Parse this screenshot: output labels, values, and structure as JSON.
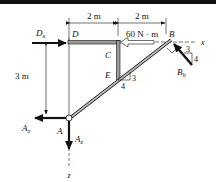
{
  "figure": {
    "type": "free-body-diagram",
    "colors": {
      "ink": "#111111",
      "member_fill": "#9a9a9a",
      "background": "#ffffff"
    }
  },
  "dimensions": {
    "top_left": "2 m",
    "top_right": "2 m",
    "left_vertical": "3 m"
  },
  "points": {
    "A": "A",
    "B": "B",
    "C": "C",
    "D": "D",
    "E": "E"
  },
  "forces": {
    "Dx": {
      "main": "D",
      "sub": "x"
    },
    "Ax": {
      "main": "A",
      "sub": "x"
    },
    "Az": {
      "main": "A",
      "sub": "z"
    },
    "Bh": {
      "main": "B",
      "sub": "h"
    },
    "moment": "60 N · m"
  },
  "axes": {
    "x": "x",
    "z": "z"
  },
  "slopes": {
    "rod_at_E": {
      "rise": "3",
      "run": "4"
    },
    "force_at_B": {
      "horizontal": "3",
      "vertical": "4"
    }
  }
}
